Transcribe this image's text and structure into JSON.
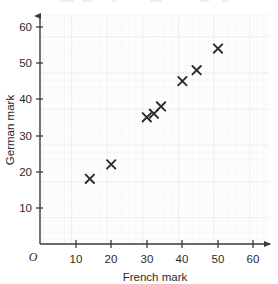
{
  "chart_data": {
    "type": "scatter",
    "title": "",
    "subtitle": "",
    "xlabel": "French mark",
    "ylabel": "German mark",
    "xlim": [
      0,
      64
    ],
    "ylim": [
      0,
      64
    ],
    "xticks": [
      10,
      20,
      30,
      40,
      50,
      60
    ],
    "yticks": [
      10,
      20,
      30,
      40,
      50,
      60
    ],
    "xtick_labels": [
      "10",
      "20",
      "30",
      "40",
      "50",
      "60"
    ],
    "ytick_labels": [
      "10",
      "20",
      "30",
      "40",
      "50",
      "60"
    ],
    "origin_label": "O",
    "grid": true,
    "grid_minor_step": 2,
    "grid_major_step": 10,
    "legend": null,
    "legend_position": "none",
    "marker": "x",
    "marker_color": "#2b2b2b",
    "points": [
      {
        "x": 14,
        "y": 18
      },
      {
        "x": 20,
        "y": 22
      },
      {
        "x": 30,
        "y": 35
      },
      {
        "x": 32,
        "y": 36
      },
      {
        "x": 34,
        "y": 38
      },
      {
        "x": 40,
        "y": 45
      },
      {
        "x": 44,
        "y": 48
      },
      {
        "x": 50,
        "y": 54
      }
    ],
    "n_points": 8
  },
  "axes": {
    "x_axis_name": "French mark",
    "y_axis_name": "German mark",
    "origin": "O",
    "arrow_x": "right-arrow",
    "arrow_y": "up-arrow"
  },
  "colors": {
    "axis": "#3a3a3a",
    "marker": "#2b2b2b",
    "grid_minor": "#f1f1f1",
    "grid_major": "#e4e4e4",
    "plot_background": "#fcfcfc",
    "page_background": "#ffffff",
    "text": "#2b2b2b"
  }
}
